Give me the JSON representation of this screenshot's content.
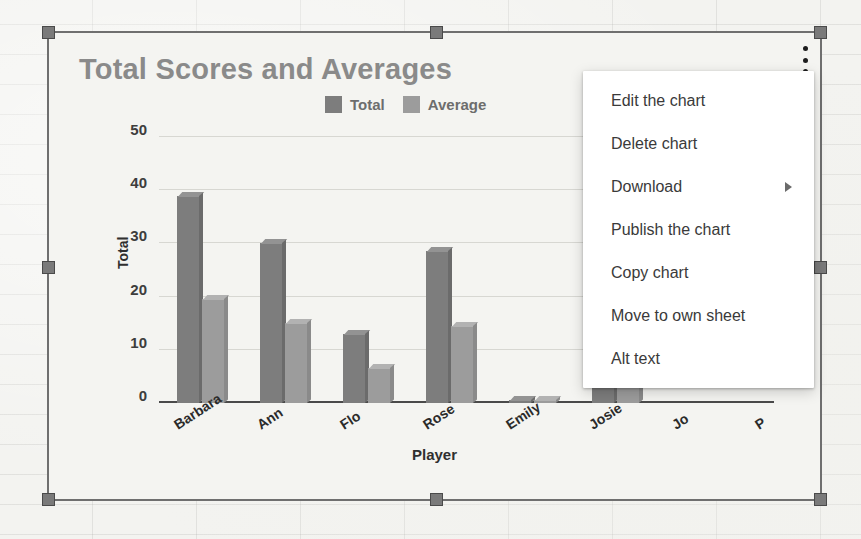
{
  "chart_data": {
    "type": "bar",
    "title": "Total Scores and Averages",
    "xlabel": "Player",
    "ylabel": "Total",
    "categories": [
      "Barbara",
      "Ann",
      "Flo",
      "Rose",
      "Emily",
      "Josie"
    ],
    "hidden_categories": [
      "Jo",
      "P"
    ],
    "series": [
      {
        "name": "Total",
        "color": "#7d7d7d",
        "values": [
          39,
          30,
          13,
          28.5,
          0.4,
          41
        ]
      },
      {
        "name": "Average",
        "color": "#9c9c9c",
        "values": [
          19.5,
          15,
          6.5,
          14.5,
          0.4,
          20.5
        ]
      }
    ],
    "yticks": [
      0,
      10,
      20,
      30,
      40,
      50
    ],
    "ylim": [
      0,
      50
    ],
    "grid": true,
    "legend_position": "top-right",
    "title_color": "#8a8a8a"
  },
  "legend": {
    "items": [
      {
        "label": "Total",
        "color": "#7d7d7d"
      },
      {
        "label": "Average",
        "color": "#9c9c9c"
      }
    ]
  },
  "context_menu": {
    "items": [
      {
        "label": "Edit the chart",
        "submenu": false
      },
      {
        "label": "Delete chart",
        "submenu": false
      },
      {
        "label": "Download",
        "submenu": true
      },
      {
        "label": "Publish the chart",
        "submenu": false
      },
      {
        "label": "Copy chart",
        "submenu": false
      },
      {
        "label": "Move to own sheet",
        "submenu": false
      },
      {
        "label": "Alt text",
        "submenu": false
      }
    ]
  },
  "overlay": {
    "kebab_icon": "more-vert-icon",
    "pointer_icon": "arrow-right-icon",
    "selection": "chart-selected"
  }
}
